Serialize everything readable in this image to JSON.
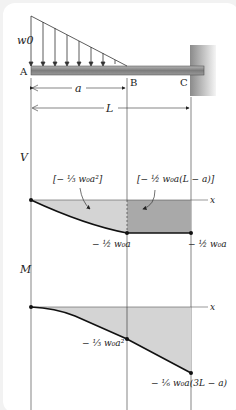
{
  "figure": {
    "load_label": "w0",
    "points": {
      "A": "A",
      "B": "B",
      "C": "C"
    },
    "dimensions": {
      "a": "a",
      "L": "L"
    },
    "shear": {
      "axis_label": "V",
      "x_label": "x",
      "area_left": "[− ⅓ w₀a²]",
      "area_right": "[− ½ w₀a(L − a)]",
      "value_B": "− ½ w₀a",
      "value_C": "− ½ w₀a"
    },
    "moment": {
      "axis_label": "M",
      "x_label": "x",
      "value_B": "− ⅓ w₀a²",
      "value_C": "− ⅙ w₀a(3L − a)"
    }
  },
  "colors": {
    "beam": "#8a8a8a",
    "wall": "#9a9a9a",
    "light_fill": "#d4d4d4",
    "dark_fill": "#a9a9a9",
    "line": "#111111"
  }
}
